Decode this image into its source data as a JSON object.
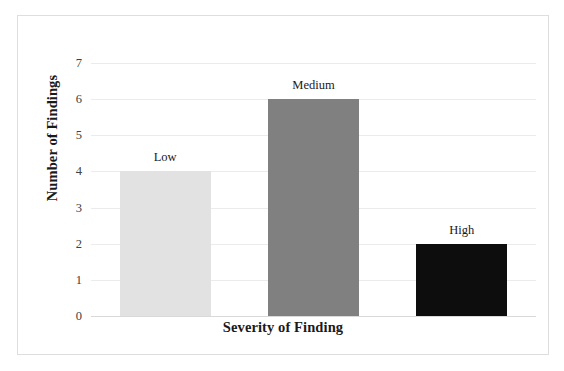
{
  "chart_data": {
    "type": "bar",
    "title": "",
    "subtitle": "",
    "xlabel": "Severity of Finding",
    "ylabel": "Number of Findings",
    "categories": [
      "Low",
      "Medium",
      "High"
    ],
    "values": [
      4,
      6,
      2
    ],
    "data_labels": [
      "Low",
      "Medium",
      "High"
    ],
    "ylim": [
      0,
      7
    ],
    "ytick_labels": [
      "0",
      "1",
      "2",
      "3",
      "4",
      "5",
      "6",
      "7"
    ],
    "ytick_values": [
      0,
      1,
      2,
      3,
      4,
      5,
      6,
      7
    ],
    "xtick_labels": [],
    "grid": true,
    "grid_axis": "y",
    "legend": false,
    "legend_position": "none",
    "bar_colors": [
      "#e2e2e2",
      "#808080",
      "#0d0d0d"
    ],
    "series": [
      {
        "name": "Number of Findings",
        "values": [
          4,
          6,
          2
        ]
      }
    ],
    "annotations": [
      {
        "text": "Low",
        "value": 4,
        "category": "Low"
      },
      {
        "text": "Medium",
        "value": 6,
        "category": "Medium"
      },
      {
        "text": "High",
        "value": 2,
        "category": "High"
      }
    ]
  },
  "frame": {
    "border_color": "#dedede",
    "background": "#ffffff",
    "gridline_color": "#ebebeb"
  }
}
